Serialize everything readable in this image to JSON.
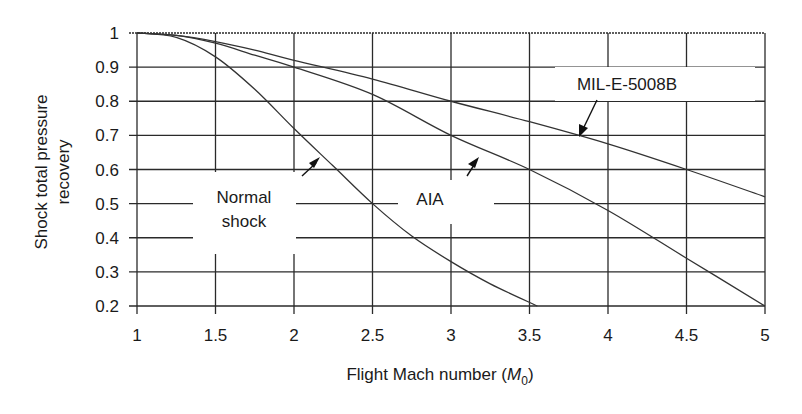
{
  "chart_data": {
    "type": "line",
    "title": "",
    "xlabel": "Flight Mach number (M0)",
    "xlabel_parts": {
      "main": "Flight Mach number (",
      "var": "M",
      "sub": "0",
      "close": ")"
    },
    "ylabel_lines": [
      "Shock total pressure",
      "recovery"
    ],
    "ylabel": "Shock total pressure recovery",
    "xlim": [
      1,
      5
    ],
    "ylim": [
      0.2,
      1
    ],
    "x_ticks": [
      1,
      1.5,
      2,
      2.5,
      3,
      3.5,
      4,
      4.5,
      5
    ],
    "x_tick_labels": [
      "1",
      "1.5",
      "2",
      "2.5",
      "3",
      "3.5",
      "4",
      "4.5",
      "5"
    ],
    "y_ticks": [
      0.2,
      0.3,
      0.4,
      0.5,
      0.6,
      0.7,
      0.8,
      0.9,
      1
    ],
    "y_tick_labels": [
      "0.2",
      "0.3",
      "0.4",
      "0.5",
      "0.6",
      "0.7",
      "0.8",
      "0.9",
      "1"
    ],
    "grid": true,
    "legend": "inline annotations with arrows",
    "series": [
      {
        "name": "Normal shock",
        "x": [
          1,
          1.25,
          1.5,
          1.75,
          2,
          2.25,
          2.5,
          2.75,
          3,
          3.25,
          3.55
        ],
        "values": [
          1,
          0.987,
          0.93,
          0.835,
          0.72,
          0.61,
          0.5,
          0.405,
          0.33,
          0.265,
          0.2
        ]
      },
      {
        "name": "AIA",
        "x": [
          1,
          1.25,
          1.5,
          1.75,
          2,
          2.5,
          3,
          3.5,
          4,
          4.5,
          5
        ],
        "values": [
          1,
          0.993,
          0.97,
          0.935,
          0.9,
          0.82,
          0.7,
          0.6,
          0.48,
          0.34,
          0.2
        ]
      },
      {
        "name": "MIL-E-5008B",
        "x": [
          1,
          1.25,
          1.5,
          1.75,
          2,
          2.5,
          3,
          3.5,
          4,
          4.5,
          5
        ],
        "values": [
          1,
          0.993,
          0.975,
          0.95,
          0.92,
          0.865,
          0.8,
          0.74,
          0.675,
          0.6,
          0.52
        ]
      }
    ],
    "annotations": [
      {
        "text_lines": [
          "Normal",
          "shock"
        ],
        "series": "Normal shock",
        "arrow_to": [
          2.2,
          0.65
        ]
      },
      {
        "text_lines": [
          "AIA"
        ],
        "series": "AIA",
        "arrow_to": [
          3.2,
          0.65
        ]
      },
      {
        "text_lines": [
          "MIL-E-5008B"
        ],
        "series": "MIL-E-5008B",
        "arrow_to": [
          3.8,
          0.7
        ]
      }
    ]
  },
  "colors": {
    "background": "#ffffff",
    "line": "#333333",
    "grid": "#2a2a2a",
    "text": "#1a1a1a"
  }
}
